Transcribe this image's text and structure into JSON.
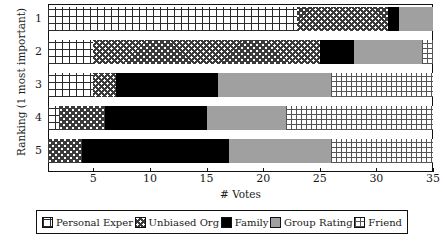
{
  "chart_data": {
    "type": "bar",
    "orientation": "horizontal",
    "stacked": true,
    "title": "",
    "xlabel": "# Votes",
    "ylabel": "Ranking (1 most important)",
    "categories": [
      "1",
      "2",
      "3",
      "4",
      "5"
    ],
    "xlim": [
      1,
      35
    ],
    "xticks": [
      5,
      10,
      15,
      20,
      25,
      30,
      35
    ],
    "xticklabels": [
      "5",
      "10",
      "15",
      "20",
      "25",
      "30",
      "35"
    ],
    "grid": false,
    "legend_position": "below",
    "series": [
      {
        "name": "Personal Exper",
        "color": "#ffffff",
        "pattern": "grid-coarse",
        "values": [
          22,
          4,
          4,
          1,
          0
        ]
      },
      {
        "name": "Unbiased Org",
        "color": "#ffffff",
        "pattern": "checkerboard",
        "values": [
          8,
          20,
          2,
          4,
          3
        ]
      },
      {
        "name": "Family",
        "color": "#000000",
        "pattern": "solid",
        "values": [
          1,
          3,
          9,
          9,
          13
        ]
      },
      {
        "name": "Group Rating",
        "color": "#a0a0a0",
        "pattern": "solid",
        "values": [
          3,
          6,
          10,
          7,
          9
        ]
      },
      {
        "name": "Friend",
        "color": "#ffffff",
        "pattern": "grid-fine",
        "values": [
          0,
          1,
          9,
          13,
          9
        ]
      }
    ],
    "bar_totals": [
      34,
      34,
      34,
      34,
      34
    ],
    "segment_cumulative": {
      "1": [
        23,
        31,
        32,
        35,
        35
      ],
      "2": [
        5,
        25,
        28,
        34,
        35
      ],
      "3": [
        5,
        7,
        16,
        26,
        35
      ],
      "4": [
        2,
        6,
        15,
        22,
        35
      ],
      "5": [
        1,
        4,
        17,
        26,
        35
      ]
    }
  },
  "legend": {
    "items": [
      {
        "label": "Personal Exper",
        "swatch": "personal-exper-swatch"
      },
      {
        "label": "Unbiased Org",
        "swatch": "unbiased-org-swatch"
      },
      {
        "label": "Family",
        "swatch": "family-swatch"
      },
      {
        "label": "Group Rating",
        "swatch": "group-rating-swatch"
      },
      {
        "label": "Friend",
        "swatch": "friend-swatch"
      }
    ]
  }
}
